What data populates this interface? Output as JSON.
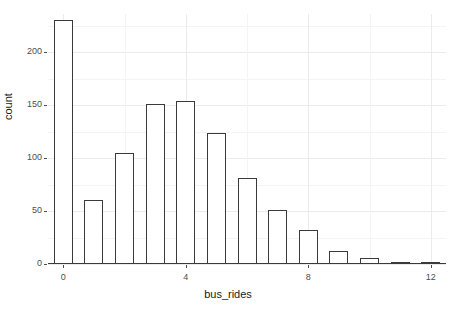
{
  "chart_data": {
    "type": "bar",
    "title": "",
    "subtitle": "",
    "xlabel": "bus_rides",
    "ylabel": "count",
    "categories": [
      0,
      1,
      2,
      3,
      4,
      5,
      6,
      7,
      8,
      9,
      10,
      11,
      12
    ],
    "values": [
      230,
      60,
      105,
      151,
      154,
      124,
      81,
      51,
      32,
      12,
      6,
      0,
      2
    ],
    "xlim": [
      -0.5,
      12.5
    ],
    "ylim": [
      0,
      236
    ],
    "xticks": [
      0,
      4,
      8,
      12
    ],
    "xtick_labels": [
      "0",
      "4",
      "8",
      "12"
    ],
    "yticks": [
      0,
      50,
      100,
      150,
      200
    ],
    "ytick_labels": [
      "0",
      "50",
      "100",
      "150",
      "200"
    ],
    "x_minor_ticks": [
      2,
      6,
      10
    ],
    "y_minor_ticks": [
      25,
      75,
      125,
      175,
      225
    ],
    "grid": true,
    "legend": "none",
    "bar_fill": "#ffffff",
    "bar_stroke": "#3a3a3a",
    "panel_background": "#ffffff",
    "grid_major_color": "#ebebeb",
    "grid_minor_color": "#f4f4f4",
    "axis_text_color": "#4d4d4d",
    "axis_title_color": "#1a1a1a"
  }
}
